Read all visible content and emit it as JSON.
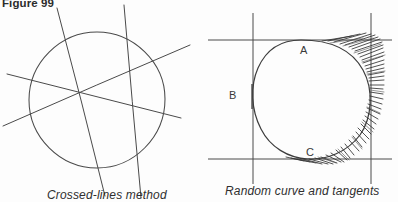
{
  "figure": {
    "number_label": "Figure 99",
    "ink_color": "#4a4a4a",
    "dark_ink_color": "#2b2b2b",
    "background_color": "#fdfdfd"
  },
  "panels": [
    {
      "id": "crossed-lines",
      "caption": "Crossed-lines method",
      "shape": "circle",
      "circle": {
        "cx": 97,
        "cy": 100,
        "r": 68
      },
      "chord_lines": [
        {
          "name": "chord-1",
          "x1": 57,
          "y1": 8,
          "x2": 105,
          "y2": 196
        },
        {
          "name": "chord-2",
          "x1": 124,
          "y1": 5,
          "x2": 141,
          "y2": 198
        },
        {
          "name": "chord-3",
          "x1": 7,
          "y1": 74,
          "x2": 181,
          "y2": 118
        },
        {
          "name": "chord-4",
          "x1": 3,
          "y1": 126,
          "x2": 190,
          "y2": 45
        }
      ]
    },
    {
      "id": "random-curve",
      "caption": "Random curve and tangents",
      "shape": "closed-curve",
      "bounding_lines": [
        {
          "name": "tangent-line-top",
          "orientation": "horizontal",
          "x1": 208,
          "y1": 40,
          "x2": 392,
          "y2": 40
        },
        {
          "name": "tangent-line-bottom",
          "orientation": "horizontal",
          "x1": 208,
          "y1": 159,
          "x2": 392,
          "y2": 159
        },
        {
          "name": "tangent-line-left",
          "orientation": "vertical",
          "x1": 253,
          "y1": 13,
          "x2": 253,
          "y2": 184
        },
        {
          "name": "tangent-line-right",
          "orientation": "vertical",
          "x1": 371,
          "y1": 13,
          "x2": 371,
          "y2": 184
        }
      ],
      "point_labels": [
        {
          "name": "point-a",
          "text": "A",
          "x": 303,
          "y": 52
        },
        {
          "name": "point-b",
          "text": "B",
          "x": 232,
          "y": 96
        },
        {
          "name": "point-c",
          "text": "C",
          "x": 309,
          "y": 154
        }
      ]
    }
  ]
}
